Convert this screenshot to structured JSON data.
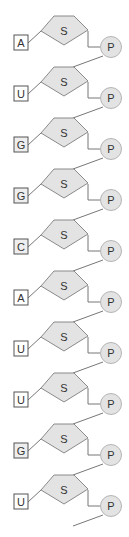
{
  "diagram": {
    "title": "",
    "sugar_label": "S",
    "phosphate_label": "P",
    "units": [
      {
        "base": "A",
        "base_fill": "#ffffff"
      },
      {
        "base": "U",
        "base_fill": "#ffffff"
      },
      {
        "base": "G",
        "base_fill": "#eeeeee"
      },
      {
        "base": "G",
        "base_fill": "#eeeeee"
      },
      {
        "base": "C",
        "base_fill": "#eeeeee"
      },
      {
        "base": "A",
        "base_fill": "#ffffff"
      },
      {
        "base": "U",
        "base_fill": "#ffffff"
      },
      {
        "base": "U",
        "base_fill": "#ffffff"
      },
      {
        "base": "G",
        "base_fill": "#eeeeee"
      },
      {
        "base": "U",
        "base_fill": "#ffffff"
      }
    ],
    "colors": {
      "sugar_fill": "#e3e3e3",
      "phosphate_fill": "#e3e3e3",
      "stroke": "#777777"
    }
  }
}
